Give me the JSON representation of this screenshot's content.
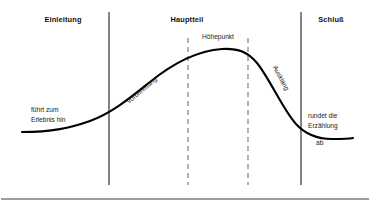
{
  "figure": {
    "title_visible": false,
    "background_color": "#ffffff",
    "curve_color": "#000000",
    "solid_divider_color": "#2b2b2b",
    "dashed_divider_color": "#8a8a8a",
    "frame_rule_color": "#3a3a3a"
  },
  "sections": [
    {
      "id": "einleitung",
      "label": "Einleitung",
      "x": 63,
      "y": 22
    },
    {
      "id": "hauptteil",
      "label": "Hauptteil",
      "x": 187,
      "y": 22
    },
    {
      "id": "schluss",
      "label": "Schluß",
      "x": 331,
      "y": 22
    }
  ],
  "peak": {
    "label": "Höhepunkt",
    "x": 218,
    "y": 39
  },
  "slope_labels": [
    {
      "id": "vorbereitung",
      "label": "Vorbereitung",
      "x": 143,
      "y": 92,
      "rotation": -40
    },
    {
      "id": "ausklang",
      "label": "Ausklang",
      "x": 279,
      "y": 79,
      "rotation": 62
    }
  ],
  "annotations": [
    {
      "id": "left-note",
      "lines": [
        "führt zum",
        "Erlebnis hin"
      ],
      "x": 31,
      "y": 112,
      "line_height": 9.5
    },
    {
      "id": "right-note",
      "lines": [
        "rundet die",
        "Erzählung",
        "ab"
      ],
      "x": 308,
      "y": 118,
      "line_height": 9.5
    }
  ],
  "dividers": {
    "solid": [
      {
        "id": "einleitung-hauptteil",
        "x": 109,
        "y1": 12,
        "y2": 185
      },
      {
        "id": "hauptteil-schluss",
        "x": 301,
        "y1": 12,
        "y2": 185
      }
    ],
    "dashed": [
      {
        "id": "hoehepunkt-start",
        "x": 188,
        "y1": 38,
        "y2": 185
      },
      {
        "id": "hoehepunkt-end",
        "x": 248,
        "y1": 38,
        "y2": 185
      }
    ]
  },
  "curve": {
    "path": "M 22,132 C 52,132 70,128 90,121 C 112,113 130,98 150,82 C 172,64 196,51 222,49 C 238,48 248,52 257,63 C 270,79 283,110 296,124 C 306,135 318,139 332,139 C 342,139 348,139 353,138",
    "stroke_width": 2.1
  },
  "frame": {
    "bottom_rule": {
      "x1": 1,
      "x2": 369,
      "y": 199
    }
  }
}
